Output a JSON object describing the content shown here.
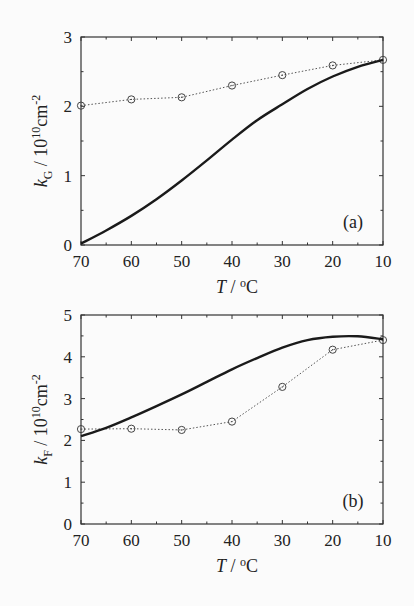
{
  "chart_data": [
    {
      "type": "line",
      "panel_label": "(a)",
      "xlabel": "T / °C",
      "ylabel": "k_G / 10^10 cm^-2",
      "ylabel_parts": {
        "sym": "k",
        "sub": "G",
        "unit_pre": " / 10",
        "exp": "10",
        "unit": "cm",
        "unit_exp": "-2"
      },
      "xlim": [
        70,
        10
      ],
      "ylim": [
        0,
        3
      ],
      "x_ticks": [
        70,
        60,
        50,
        40,
        30,
        20,
        10
      ],
      "y_ticks": [
        0,
        1,
        2,
        3
      ],
      "grid": false,
      "series": [
        {
          "name": "measured",
          "style": "dotted-circles",
          "x": [
            70,
            60,
            50,
            40,
            30,
            20,
            10
          ],
          "values": [
            2.01,
            2.1,
            2.13,
            2.3,
            2.45,
            2.59,
            2.67
          ]
        },
        {
          "name": "calculated",
          "style": "solid",
          "x": [
            70,
            65,
            60,
            55,
            50,
            45,
            40,
            35,
            30,
            25,
            20,
            15,
            10
          ],
          "values": [
            0.02,
            0.21,
            0.42,
            0.66,
            0.93,
            1.22,
            1.52,
            1.8,
            2.03,
            2.25,
            2.43,
            2.57,
            2.67
          ]
        }
      ]
    },
    {
      "type": "line",
      "panel_label": "(b)",
      "xlabel": "T / °C",
      "ylabel": "k_F / 10^10 cm^-2",
      "ylabel_parts": {
        "sym": "k",
        "sub": "F",
        "unit_pre": " / 10",
        "exp": "10",
        "unit": "cm",
        "unit_exp": "-2"
      },
      "xlim": [
        70,
        10
      ],
      "ylim": [
        0,
        5
      ],
      "x_ticks": [
        70,
        60,
        50,
        40,
        30,
        20,
        10
      ],
      "y_ticks": [
        0,
        1,
        2,
        3,
        4,
        5
      ],
      "grid": false,
      "series": [
        {
          "name": "measured",
          "style": "dotted-circles",
          "x": [
            70,
            60,
            50,
            40,
            30,
            20,
            10
          ],
          "values": [
            2.27,
            2.28,
            2.25,
            2.45,
            3.28,
            4.17,
            4.4
          ]
        },
        {
          "name": "calculated",
          "style": "solid",
          "x": [
            70,
            65,
            60,
            55,
            50,
            45,
            40,
            35,
            30,
            25,
            20,
            15,
            10
          ],
          "values": [
            2.1,
            2.3,
            2.55,
            2.82,
            3.1,
            3.4,
            3.7,
            3.97,
            4.22,
            4.4,
            4.48,
            4.49,
            4.42
          ]
        }
      ]
    }
  ],
  "panels": [
    {
      "label": "(a)",
      "x_unit": "°C",
      "x_sym": "T",
      "x_sep": " / "
    },
    {
      "label": "(b)",
      "x_unit": "°C",
      "x_sym": "T",
      "x_sep": " / "
    }
  ]
}
